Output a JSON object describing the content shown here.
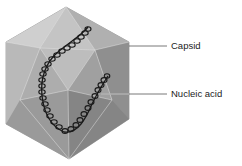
{
  "figure": {
    "labels": [
      {
        "id": "capsid",
        "text": "Capsid"
      },
      {
        "id": "nucleic_acid",
        "text": "Nucleic acid"
      }
    ],
    "colors": {
      "capsid_light": "#c8c8c8",
      "capsid_mid": "#a9a9a9",
      "capsid_dark": "#7d7d7d",
      "nucleic_acid": "#1a1a1a",
      "leader_line": "#555555"
    }
  }
}
